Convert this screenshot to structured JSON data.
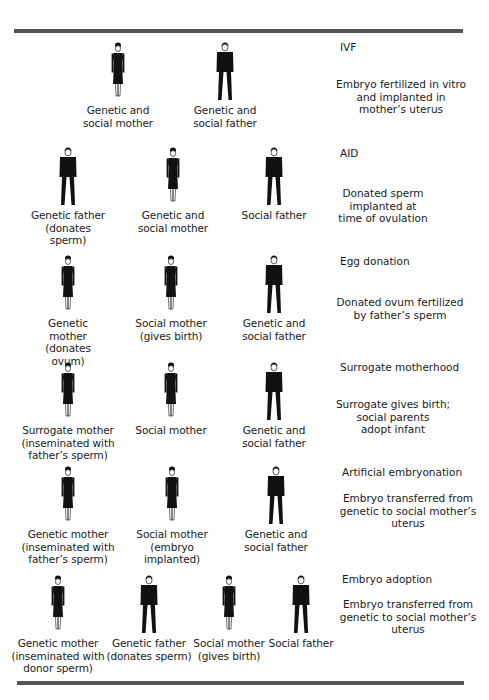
{
  "rows": [
    {
      "title": "IVF",
      "description": "Embryo fertilized in vitro\nand implanted in\nmother’s uterus",
      "figures": [
        {
          "type": "female",
          "caption": "Genetic and\nsocial mother"
        },
        {
          "type": "male",
          "caption": "Genetic and\nsocial father"
        }
      ]
    },
    {
      "title": "AID",
      "description": "Donated sperm\nimplanted at\ntime of ovulation",
      "figures": [
        {
          "type": "male",
          "caption": "Genetic father\n(donates sperm)"
        },
        {
          "type": "female",
          "caption": "Genetic and\nsocial mother"
        },
        {
          "type": "male",
          "caption": "Social father"
        }
      ]
    },
    {
      "title": "Egg donation",
      "description": "Donated ovum fertilized\nby father’s sperm",
      "figures": [
        {
          "type": "female",
          "caption": "Genetic mother\n(donates ovum)"
        },
        {
          "type": "female",
          "caption": "Social mother\n(gives birth)"
        },
        {
          "type": "male",
          "caption": "Genetic and\nsocial father"
        }
      ]
    },
    {
      "title": "Surrogate motherhood",
      "description": "Surrogate gives birth;\nsocial parents\nadopt infant",
      "figures": [
        {
          "type": "female",
          "caption": "Surrogate mother\n(inseminated with\nfather’s sperm)"
        },
        {
          "type": "female",
          "caption": "Social mother"
        },
        {
          "type": "male",
          "caption": "Genetic and\nsocial father"
        }
      ]
    },
    {
      "title": "Artificial embryonation",
      "description": "Embryo transferred from\ngenetic to social mother’s\nuterus",
      "figures": [
        {
          "type": "female",
          "caption": "Genetic mother\n(inseminated with\nfather’s sperm)"
        },
        {
          "type": "female",
          "caption": "Social mother\n(embryo implanted)"
        },
        {
          "type": "male",
          "caption": "Genetic and\nsocial father"
        }
      ]
    },
    {
      "title": "Embryo adoption",
      "description": "Embryo transferred from\ngenetic to social mother’s\nuterus",
      "figures": [
        {
          "type": "female",
          "caption": "Genetic mother\n(inseminated with\ndonor sperm)"
        },
        {
          "type": "male",
          "caption": "Genetic father\n(donates sperm)"
        },
        {
          "type": "female",
          "caption": "Social mother\n(gives birth)"
        },
        {
          "type": "male",
          "caption": "Social father"
        }
      ]
    }
  ],
  "colors": {
    "rule": "#555555",
    "figure": "#111111",
    "text": "#1a1a1a"
  }
}
